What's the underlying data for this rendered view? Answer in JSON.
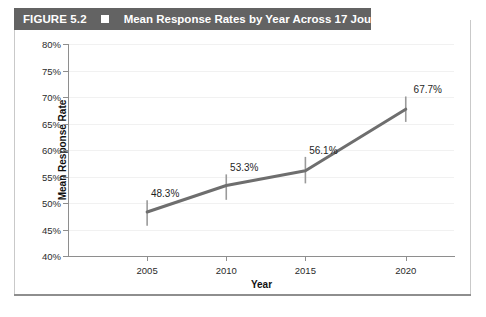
{
  "figure": {
    "number_label": "FIGURE 5.2",
    "bullet_icon": "filled-square-icon",
    "title": "Mean Response Rates by Year Across 17 Journals",
    "header_bg": "#636363",
    "header_text_color": "#ffffff"
  },
  "chart_data": {
    "type": "line",
    "title": "Mean Response Rates by Year Across 17 Journals",
    "xlabel": "Year",
    "ylabel": "Mean Response Rate",
    "categories": [
      "2005",
      "2010",
      "2015",
      "2020"
    ],
    "x": [
      2005,
      2010,
      2015,
      2020
    ],
    "values": [
      48.3,
      53.3,
      56.1,
      67.7
    ],
    "point_labels": [
      "48.3%",
      "53.3%",
      "56.1%",
      "67.7%"
    ],
    "error_bars": {
      "low": [
        45.7,
        50.6,
        53.7,
        65.3
      ],
      "high": [
        50.5,
        55.4,
        58.7,
        70.1
      ]
    },
    "ylim": [
      40,
      80
    ],
    "ytick_values": [
      40,
      45,
      50,
      55,
      60,
      65,
      70,
      75,
      80
    ],
    "ytick_labels": [
      "40%",
      "45%",
      "50%",
      "55%",
      "60%",
      "65%",
      "70%",
      "75%",
      "80%"
    ],
    "xtick_labels": [
      "2005",
      "2010",
      "2015",
      "2020"
    ],
    "grid": "horizontal",
    "legend": "none",
    "series_color": "#6e6e6e",
    "errorbar_color": "#9a9a9a",
    "gridline_color": "#f1f1f1",
    "axis_color": "#8e8e8e"
  }
}
